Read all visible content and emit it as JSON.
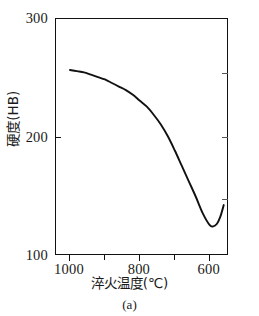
{
  "figure": {
    "caption": "(a)"
  },
  "chart_data": {
    "type": "line",
    "title": "",
    "subtitle": "",
    "xlabel": "淬火温度(℃)",
    "ylabel": "硬度(HB)",
    "xlim": [
      1040,
      545
    ],
    "ylim": [
      100,
      300
    ],
    "x_axis_reversed": true,
    "grid": false,
    "legend": null,
    "xticks": [
      1000,
      800,
      600
    ],
    "xtick_labels": [
      "1000",
      "800",
      "600"
    ],
    "xticks_minor": [
      900,
      700
    ],
    "yticks": [
      100,
      200,
      300
    ],
    "ytick_labels": [
      "100",
      "200",
      "300"
    ],
    "series": [
      {
        "name": "硬度(HB)",
        "color": "#111111",
        "x": [
          1000,
          980,
          960,
          940,
          920,
          900,
          880,
          860,
          840,
          820,
          800,
          780,
          760,
          740,
          720,
          700,
          680,
          660,
          640,
          620,
          600,
          590,
          580,
          570,
          560
        ],
        "y": [
          257,
          256,
          255,
          253,
          251,
          249,
          246,
          243,
          240,
          236,
          231,
          226,
          219,
          211,
          201,
          189,
          176,
          163,
          150,
          136,
          126,
          125,
          127,
          133,
          143
        ]
      }
    ],
    "annotations": [
      {
        "label": "curve-start",
        "x": 1000,
        "y": 257
      },
      {
        "label": "curve-minimum",
        "x": 595,
        "y": 125
      },
      {
        "label": "curve-end",
        "x": 560,
        "y": 143
      }
    ]
  },
  "axes": {
    "y": {
      "labels": [
        "300",
        "200",
        "100"
      ]
    },
    "x": {
      "labels": [
        "1000",
        "800",
        "600"
      ]
    }
  }
}
